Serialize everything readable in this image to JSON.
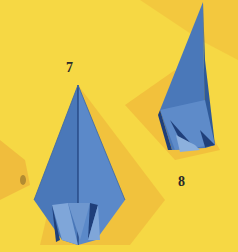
{
  "image": {
    "description": "Photograph of two origami folding steps on a yellow background",
    "background_color": "#f6d844",
    "shadow_color": "#f0b93a",
    "paper_color": "#4a78b9",
    "paper_dark": "#1f3f7a",
    "paper_light": "#7fa6d9"
  },
  "steps": [
    {
      "label": "7",
      "x": 66,
      "y": 61
    },
    {
      "label": "8",
      "x": 178,
      "y": 175
    }
  ]
}
